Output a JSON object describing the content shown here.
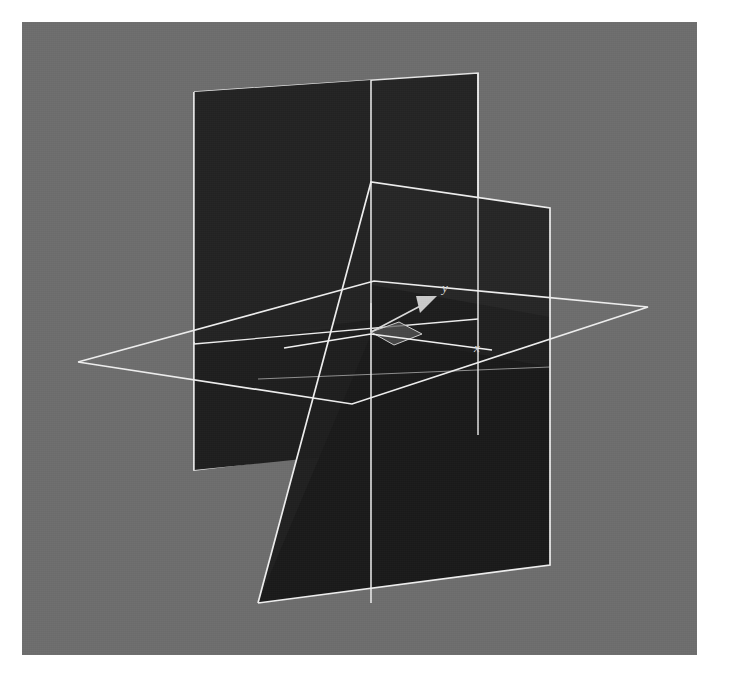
{
  "figure": {
    "background_color": "#6e6e6e",
    "page_color": "#ffffff",
    "edge_color": "#e8e8e8",
    "plane_fill_dark": "#1f1f1f",
    "plane_fill_mid": "#272727",
    "plane_fill_light": "#2e2e2e",
    "viewport": {
      "x": 22,
      "y": 22,
      "width": 675,
      "height": 633
    }
  },
  "labels": {
    "x_axis": "x",
    "y_axis": "y"
  },
  "chart_data": {
    "type": "scatter",
    "title": "",
    "xlabel": "x",
    "ylabel": "y",
    "geometry": {
      "origin_px": [
        349,
        310
      ],
      "planes": [
        {
          "name": "xy-plane-horizontal",
          "fill": "none",
          "outline_px": [
            [
              56,
              340
            ],
            [
              352,
              259
            ],
            [
              626,
              285
            ],
            [
              330,
              382
            ]
          ]
        },
        {
          "name": "yz-plane-back-left",
          "fill": "#242424",
          "outline_px": [
            [
              172,
              70
            ],
            [
              456,
              51
            ],
            [
              456,
              413
            ],
            [
              172,
              448
            ]
          ]
        },
        {
          "name": "xz-plane-front-right",
          "fill": "#1d1d1d",
          "outline_px": [
            [
              236,
              581
            ],
            [
              349,
              160
            ],
            [
              528,
              186
            ],
            [
              528,
              543
            ]
          ]
        }
      ],
      "gizmo": {
        "y_arrow_from_px": [
          349,
          310
        ],
        "y_arrow_to_px": [
          411,
          276
        ],
        "z_tick_from_px": [
          349,
          310
        ],
        "z_tick_to_px": [
          349,
          281
        ],
        "xy_patch_px": [
          [
            349,
            310
          ],
          [
            377,
            300
          ],
          [
            400,
            312
          ],
          [
            372,
            323
          ]
        ]
      }
    }
  }
}
